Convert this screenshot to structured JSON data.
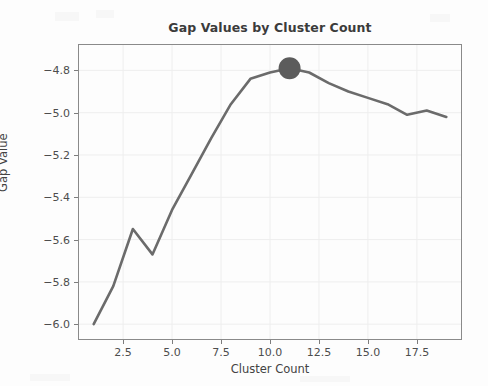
{
  "chart_data": {
    "type": "line",
    "title": "Gap Values by Cluster Count",
    "xlabel": "Cluster Count",
    "ylabel": "Gap Value",
    "x": [
      1,
      2,
      3,
      4,
      5,
      6,
      7,
      8,
      9,
      10,
      11,
      12,
      13,
      14,
      15,
      16,
      17,
      18,
      19
    ],
    "values": [
      -6.0,
      -5.82,
      -5.55,
      -5.67,
      -5.46,
      -5.29,
      -5.12,
      -4.96,
      -4.84,
      -4.81,
      -4.79,
      -4.81,
      -4.86,
      -4.9,
      -4.93,
      -4.96,
      -5.01,
      -4.99,
      -5.02
    ],
    "series": [
      {
        "name": "Gap Value",
        "values": [
          -6.0,
          -5.82,
          -5.55,
          -5.67,
          -5.46,
          -5.29,
          -5.12,
          -4.96,
          -4.84,
          -4.81,
          -4.79,
          -4.81,
          -4.86,
          -4.9,
          -4.93,
          -4.96,
          -5.01,
          -4.99,
          -5.02
        ]
      }
    ],
    "xlim": [
      0.25,
      19.75
    ],
    "ylim": [
      -6.07,
      -4.68
    ],
    "xticks": [
      "2.5",
      "5.0",
      "7.5",
      "10.0",
      "12.5",
      "15.0",
      "17.5"
    ],
    "xtick_values": [
      2.5,
      5.0,
      7.5,
      10.0,
      12.5,
      15.0,
      17.5
    ],
    "yticks": [
      "−4.8",
      "−5.0",
      "−5.2",
      "−5.4",
      "−5.6",
      "−5.8",
      "−6.0"
    ],
    "ytick_values": [
      -4.8,
      -5.0,
      -5.2,
      -5.4,
      -5.6,
      -5.8,
      -6.0
    ],
    "grid": true,
    "legend": "none",
    "highlight": {
      "name": "optimal-cluster-marker",
      "x": 11,
      "y": -4.79,
      "marker": "filled-circle",
      "radius": 11
    },
    "colors": {
      "line": "#6b6b6b",
      "marker": "#5c5c5c",
      "grid": "#eeeeee",
      "axis": "#8a8a8a",
      "background": "#fdfdfd",
      "text": "#4a4a4a"
    }
  }
}
